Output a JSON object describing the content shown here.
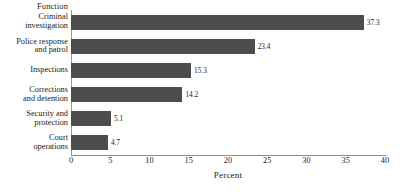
{
  "chart_data": {
    "type": "bar",
    "orientation": "horizontal",
    "title": "",
    "ylabel": "Function",
    "xlabel": "Percent",
    "categories": [
      "Criminal\ninvestigation",
      "Police response\nand patrol",
      "Inspections",
      "Corrections\nand detention",
      "Security and\nprotection",
      "Court\noperations"
    ],
    "values": [
      37.3,
      23.4,
      15.3,
      14.2,
      5.1,
      4.7
    ],
    "value_labels": [
      "37.3",
      "23.4",
      "15.3",
      "14.2",
      "5.1",
      "4.7"
    ],
    "xlim": [
      0,
      40
    ],
    "xticks": [
      0,
      5,
      10,
      15,
      20,
      25,
      30,
      35,
      40
    ],
    "xtick_labels": [
      "0",
      "5",
      "10",
      "15",
      "20",
      "25",
      "30",
      "35",
      "40"
    ],
    "grid": false,
    "legend": null,
    "bar_color": "#4d4d4d",
    "axis_color": "#8e8e8e",
    "background": "#ffffff"
  }
}
